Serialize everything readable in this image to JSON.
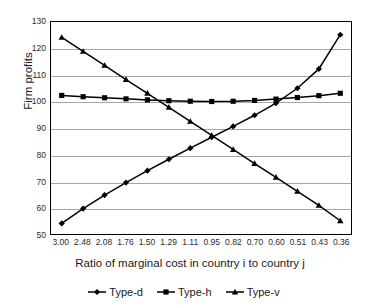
{
  "chart_data": {
    "type": "line",
    "title": "",
    "xlabel": "Ratio of marginal cost in country i to country j",
    "ylabel": "Firm profits",
    "categories": [
      "3.00",
      "2.48",
      "2.08",
      "1.76",
      "1.50",
      "1.29",
      "1.11",
      "0.95",
      "0.82",
      "0.70",
      "0.60",
      "0.51",
      "0.43",
      "0.36"
    ],
    "ylim": [
      50,
      130
    ],
    "ytick_labels": [
      "130",
      "120",
      "110",
      "100",
      "90",
      "80",
      "70",
      "60",
      "50"
    ],
    "ytick_values": [
      130,
      120,
      110,
      100,
      90,
      80,
      70,
      60,
      50
    ],
    "grid": "horizontal",
    "legend_position": "bottom",
    "series": [
      {
        "name": "Type-d",
        "marker": "diamond",
        "color": "#000000",
        "values": [
          54.0,
          59.6,
          64.7,
          69.4,
          73.9,
          78.2,
          82.4,
          86.5,
          90.6,
          94.8,
          99.4,
          105.0,
          112.3,
          125.2
        ]
      },
      {
        "name": "Type-h",
        "marker": "square",
        "color": "#000000",
        "values": [
          102.3,
          101.8,
          101.4,
          101.0,
          100.6,
          100.3,
          100.1,
          100.0,
          100.1,
          100.4,
          100.9,
          101.5,
          102.2,
          103.1
        ]
      },
      {
        "name": "Type-v",
        "marker": "triangle",
        "color": "#000000",
        "values": [
          124.2,
          118.9,
          113.6,
          108.3,
          103.1,
          97.8,
          92.5,
          87.2,
          81.9,
          76.6,
          71.4,
          66.1,
          60.8,
          55.0
        ]
      }
    ]
  },
  "legend": {
    "entries": [
      {
        "label": "Type-d"
      },
      {
        "label": "Type-h"
      },
      {
        "label": "Type-v"
      }
    ]
  },
  "colors": {
    "series": "#000000",
    "gridline": "#a6a6a6",
    "frame": "#000000",
    "background": "#ffffff"
  }
}
